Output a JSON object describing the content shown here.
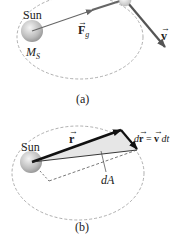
{
  "panel_a": {
    "sun_label": "Sun",
    "mass_label_M": "M",
    "mass_label_sub": "S",
    "force_label": "F",
    "force_sub": "g",
    "velocity_label": "v",
    "caption": "(a)"
  },
  "panel_b": {
    "sun_label": "Sun",
    "r_label": "r",
    "dr_label_d": "d",
    "dr_label_r": "r",
    "dr_label_eq": " = ",
    "dr_label_v": "v",
    "dr_label_dt": " dt",
    "area_label": "dA",
    "caption": "(b)"
  },
  "colors": {
    "orbit": "#9a9a9a",
    "force_arrow": "#666666",
    "velocity_arrow": "#555555",
    "r_arrow": "#111111",
    "sweep_fill": "#e6e6e6",
    "sun_fill": "#c8c8c8"
  }
}
